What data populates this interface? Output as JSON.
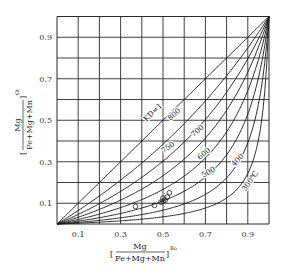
{
  "chart_data": {
    "type": "line",
    "title": "",
    "xlabel": "[Mg/(Fe+Mg+Mn)]^Bo",
    "ylabel": "[Mg/(Fe+Mg+Mn)]^Gt",
    "x_label_parts": {
      "open": "[",
      "numerator": "Mg",
      "denominator": "Fe+Mg+Mn",
      "close": "]",
      "superscript": "Bo"
    },
    "y_label_parts": {
      "open": "[",
      "numerator": "Mg",
      "denominator": "Fe+Mg+Mn",
      "close": "]",
      "superscript": "Gt"
    },
    "xlim": [
      0,
      1
    ],
    "ylim": [
      0,
      1
    ],
    "grid": true,
    "xticks": [
      "0.1",
      "0.3",
      "0.5",
      "0.7",
      "0.9"
    ],
    "yticks": [
      "0.1",
      "0.3",
      "0.5",
      "0.7",
      "0.9"
    ],
    "series": [
      {
        "name": "KD=1",
        "label": "KD=1",
        "K": 1.0
      },
      {
        "name": "800",
        "label": "800",
        "K": 1.6
      },
      {
        "name": "750",
        "label": "750",
        "K": 2.3
      },
      {
        "name": "700",
        "label": "700",
        "K": 3.3
      },
      {
        "name": "600",
        "label": "600",
        "K": 5.0
      },
      {
        "name": "500",
        "label": "500",
        "K": 8.0
      },
      {
        "name": "400",
        "label": "400",
        "K": 14.0
      },
      {
        "name": "300°C",
        "label": "300℃",
        "K": 28.0
      }
    ],
    "curve_model": "y = x / (x + K(1-x))",
    "scatter": {
      "marker": "open-circle",
      "points": [
        [
          0.37,
          0.085
        ],
        [
          0.46,
          0.09
        ],
        [
          0.49,
          0.105
        ],
        [
          0.5,
          0.11
        ],
        [
          0.51,
          0.115
        ],
        [
          0.5,
          0.125
        ],
        [
          0.52,
          0.13
        ],
        [
          0.53,
          0.15
        ]
      ]
    },
    "annotations": [
      "KD=1",
      "800",
      "750",
      "700",
      "600",
      "500",
      "400",
      "300℃"
    ]
  }
}
